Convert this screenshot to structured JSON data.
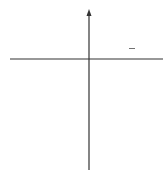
{
  "chart_data": {
    "type": "line",
    "title": "",
    "function_label": "f(x) = -1/2 x^2",
    "label_parts": {
      "f": "f(x) = −",
      "num": "1",
      "den": "2",
      "x": "x",
      "exp": "2"
    },
    "xlabel": "",
    "ylabel": "y",
    "xlim": [
      -4,
      4
    ],
    "ylim": [
      -6,
      2
    ],
    "x_ticks": [
      "−2",
      "0",
      "2"
    ],
    "y_ticks": [
      "−2",
      "−4"
    ],
    "grid": true,
    "x": [
      -3.5,
      -3,
      -2.5,
      -2,
      -1.5,
      -1,
      -0.5,
      0,
      0.5,
      1,
      1.5,
      2,
      2.5,
      3,
      3.5
    ],
    "y": [
      -6.125,
      -4.5,
      -3.125,
      -2,
      -1.125,
      -0.5,
      -0.125,
      0,
      -0.125,
      -0.5,
      -1.125,
      -2,
      -3.125,
      -4.5,
      -6.125
    ],
    "marked_points": [
      [
        -2,
        -2
      ],
      [
        -1,
        -0.5
      ],
      [
        0,
        0
      ],
      [
        1,
        -0.5
      ],
      [
        2,
        -2
      ]
    ],
    "colors": {
      "curve": "#666666",
      "grid": "#cccccc",
      "axis": "#333333",
      "point": "#555555"
    }
  }
}
